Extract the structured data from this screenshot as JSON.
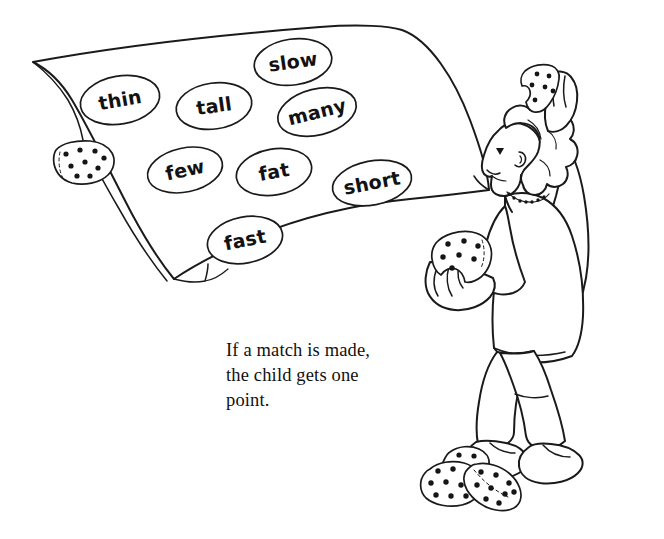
{
  "page": {
    "title": "If a match is made, the child gets one point.",
    "background_color": "#ffffff",
    "ink_color": "#1a1a1a",
    "width": 664,
    "height": 539
  },
  "illustration": {
    "name": "word-match-beanbag-toss",
    "description": "Line drawing of a child tossing spotted beanbags at a hanging sheet printed with word ovals",
    "sheet": {
      "name": "word-sheet",
      "words": [
        {
          "id": "thin",
          "label": "thin",
          "cx": 120,
          "cy": 100,
          "rx": 40,
          "ry": 24,
          "rotate": -10
        },
        {
          "id": "tall",
          "label": "tall",
          "cx": 214,
          "cy": 106,
          "rx": 38,
          "ry": 23,
          "rotate": -8
        },
        {
          "id": "slow",
          "label": "slow",
          "cx": 293,
          "cy": 62,
          "rx": 39,
          "ry": 23,
          "rotate": -8
        },
        {
          "id": "many",
          "label": "many",
          "cx": 317,
          "cy": 112,
          "rx": 40,
          "ry": 23,
          "rotate": -14
        },
        {
          "id": "few",
          "label": "few",
          "cx": 185,
          "cy": 170,
          "rx": 38,
          "ry": 22,
          "rotate": -12
        },
        {
          "id": "fat",
          "label": "fat",
          "cx": 274,
          "cy": 172,
          "rx": 38,
          "ry": 23,
          "rotate": -10
        },
        {
          "id": "short",
          "label": "short",
          "cx": 372,
          "cy": 183,
          "rx": 40,
          "ry": 22,
          "rotate": -11
        },
        {
          "id": "fast",
          "label": "fast",
          "cx": 245,
          "cy": 240,
          "rx": 38,
          "ry": 23,
          "rotate": -11
        }
      ]
    },
    "beanbags": [
      {
        "name": "beanbag-on-sheet-corner",
        "location": "left edge of sheet",
        "spots": 9
      },
      {
        "name": "beanbag-in-raised-hand",
        "location": "above head",
        "spots": 6
      },
      {
        "name": "beanbag-in-lower-hand",
        "location": "held at chest",
        "spots": 7
      },
      {
        "name": "beanbag-floor-back",
        "location": "floor pile",
        "spots": 5
      },
      {
        "name": "beanbag-floor-left",
        "location": "floor pile",
        "spots": 9
      },
      {
        "name": "beanbag-floor-right",
        "location": "floor pile",
        "spots": 9
      }
    ],
    "figure": {
      "name": "child-figure",
      "parts": [
        "curly-hair",
        "face-profile",
        "beaded-necklace",
        "raised-arm",
        "lower-arm",
        "torso",
        "legs",
        "shoes"
      ]
    }
  },
  "caption": {
    "name": "caption-text",
    "text": "If a match is made,\nthe child gets one\npoint."
  }
}
